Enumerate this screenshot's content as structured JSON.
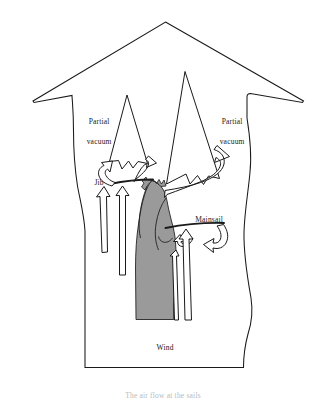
{
  "figure": {
    "caption": "The air flow at the sails",
    "colors": {
      "stroke": "#1a1a1a",
      "sail_fill": "#9a9a9a",
      "arrow_fill": "#ffffff",
      "background": "#ffffff",
      "text": "#1a1a1a"
    },
    "labels": [
      {
        "id": "partial-vacuum-left",
        "line1": "Partial",
        "line2": "vacuum",
        "x": 74,
        "y": 107
      },
      {
        "id": "partial-vacuum-right",
        "line1": "Partial",
        "line2": "vacuum",
        "x": 207,
        "y": 107
      },
      {
        "id": "jib",
        "line1": "Jib",
        "line2": "",
        "x": 85,
        "y": 170
      },
      {
        "id": "mainsail",
        "line1": "Mainsail",
        "line2": "",
        "x": 185,
        "y": 206
      },
      {
        "id": "wind",
        "line1": "Wind",
        "line2": "",
        "x": 151,
        "y": 334
      }
    ],
    "label_text": {
      "partial_vacuum_left_1": "Partial",
      "partial_vacuum_left_2": "vacuum",
      "partial_vacuum_right_1": "Partial",
      "partial_vacuum_right_2": "vacuum",
      "jib": "Jib",
      "mainsail": "Mainsail",
      "wind": "Wind"
    }
  }
}
